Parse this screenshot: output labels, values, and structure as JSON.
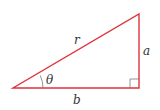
{
  "diagram": {
    "type": "right-triangle",
    "colors": {
      "triangle": "#e0323c",
      "angle_marks": "#666666",
      "text": "#333333"
    },
    "labels": {
      "hypotenuse": "r",
      "vertical_side": "a",
      "horizontal_side": "b",
      "angle": "θ"
    }
  }
}
